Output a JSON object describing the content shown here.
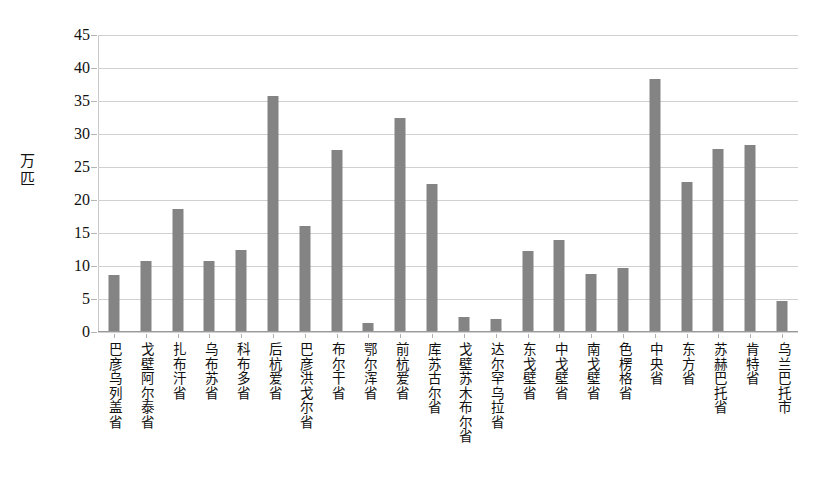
{
  "chart_data": {
    "type": "bar",
    "title": "",
    "xlabel": "",
    "ylabel": "万匹",
    "ylim": [
      0,
      45
    ],
    "ytick_step": 5,
    "yticks": [
      45,
      40,
      35,
      30,
      25,
      20,
      15,
      10,
      5,
      0
    ],
    "grid": true,
    "legend": "none",
    "bar_color": "#848484",
    "categories": [
      "巴彦乌列盖省",
      "戈壁阿尔泰省",
      "扎布汗省",
      "乌布苏省",
      "科布多省",
      "后杭爱省",
      "巴彦洪戈尔省",
      "布尔干省",
      "鄂尔浑省",
      "前杭爱省",
      "库苏古尔省",
      "戈壁苏木布尔省",
      "达尔罕乌拉省",
      "东戈壁省",
      "中戈壁省",
      "南戈壁省",
      "色楞格省",
      "中央省",
      "东方省",
      "苏赫巴托省",
      "肯特省",
      "乌兰巴托市"
    ],
    "values": [
      8.7,
      10.7,
      18.6,
      10.7,
      12.4,
      35.8,
      16.1,
      27.6,
      1.4,
      32.4,
      22.5,
      2.3,
      1.9,
      12.2,
      14.0,
      8.8,
      9.7,
      38.4,
      22.8,
      27.7,
      28.3,
      4.7
    ]
  }
}
